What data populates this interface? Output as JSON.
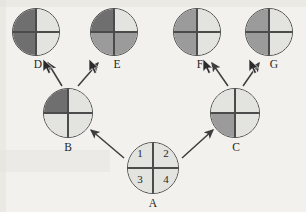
{
  "page": {
    "background_color": "#f2f1ee"
  },
  "palette": {
    "dark": "#6f6f6f",
    "medium": "#9b9b9b",
    "light": "#e3e3e0",
    "outline": "#4b4b4b",
    "text": "#262626"
  },
  "diagram": {
    "nodes": [
      {
        "id": "D",
        "label": "D",
        "x": 12,
        "y": 8,
        "size": 48,
        "quadrants": {
          "tl": "dark",
          "tr": "light",
          "bl": "dark",
          "br": "light"
        },
        "numbers": {
          "tl": "",
          "tr": "",
          "bl": "",
          "br": ""
        },
        "label_x": 26,
        "label_y": 59
      },
      {
        "id": "E",
        "label": "E",
        "x": 90,
        "y": 8,
        "size": 48,
        "quadrants": {
          "tl": "dark",
          "tr": "light",
          "bl": "medium",
          "br": "medium"
        },
        "numbers": {
          "tl": "",
          "tr": "",
          "bl": "",
          "br": ""
        },
        "label_x": 105,
        "label_y": 59
      },
      {
        "id": "F",
        "label": "F",
        "x": 173,
        "y": 8,
        "size": 48,
        "quadrants": {
          "tl": "medium",
          "tr": "light",
          "bl": "medium",
          "br": "light"
        },
        "numbers": {
          "tl": "",
          "tr": "",
          "bl": "",
          "br": ""
        },
        "label_x": 188,
        "label_y": 59
      },
      {
        "id": "G",
        "label": "G",
        "x": 245,
        "y": 8,
        "size": 48,
        "quadrants": {
          "tl": "medium",
          "tr": "light",
          "bl": "medium",
          "br": "light"
        },
        "numbers": {
          "tl": "",
          "tr": "",
          "bl": "",
          "br": ""
        },
        "label_x": 262,
        "label_y": 59
      },
      {
        "id": "B",
        "label": "B",
        "x": 43,
        "y": 88,
        "size": 50,
        "quadrants": {
          "tl": "dark",
          "tr": "light",
          "bl": "light",
          "br": "light"
        },
        "numbers": {
          "tl": "",
          "tr": "",
          "bl": "",
          "br": ""
        },
        "label_x": 56,
        "label_y": 142
      },
      {
        "id": "C",
        "label": "C",
        "x": 210,
        "y": 88,
        "size": 50,
        "quadrants": {
          "tl": "light",
          "tr": "light",
          "bl": "medium",
          "br": "light"
        },
        "numbers": {
          "tl": "",
          "tr": "",
          "bl": "",
          "br": ""
        },
        "label_x": 224,
        "label_y": 142
      },
      {
        "id": "A",
        "label": "A",
        "x": 127,
        "y": 142,
        "size": 52,
        "quadrants": {
          "tl": "light",
          "tr": "light",
          "bl": "light",
          "br": "light"
        },
        "numbers": {
          "tl": "1",
          "tr": "2",
          "bl": "3",
          "br": "4"
        },
        "label_x": 141,
        "label_y": 198
      }
    ],
    "arrows": [
      {
        "id": "A-to-B",
        "from": "A",
        "to": "B",
        "x1": 124,
        "y1": 158,
        "x2": 91,
        "y2": 130
      },
      {
        "id": "A-to-C",
        "from": "A",
        "to": "C",
        "x1": 182,
        "y1": 158,
        "x2": 213,
        "y2": 130
      },
      {
        "id": "B-to-D",
        "from": "B",
        "to": "D",
        "x1": 62,
        "y1": 86,
        "x2": 48,
        "y2": 63
      },
      {
        "id": "B-to-E",
        "from": "B",
        "to": "E",
        "x1": 78,
        "y1": 86,
        "x2": 98,
        "y2": 63
      },
      {
        "id": "C-to-F",
        "from": "C",
        "to": "F",
        "x1": 228,
        "y1": 86,
        "x2": 212,
        "y2": 63
      },
      {
        "id": "C-to-G",
        "from": "C",
        "to": "G",
        "x1": 243,
        "y1": 86,
        "x2": 259,
        "y2": 63
      }
    ],
    "cursors": [
      {
        "id": "cursor-near-D",
        "x": 42,
        "y": 58
      },
      {
        "id": "cursor-near-E",
        "x": 88,
        "y": 58
      },
      {
        "id": "cursor-near-F",
        "x": 202,
        "y": 58
      },
      {
        "id": "cursor-near-G",
        "x": 248,
        "y": 58
      }
    ]
  }
}
